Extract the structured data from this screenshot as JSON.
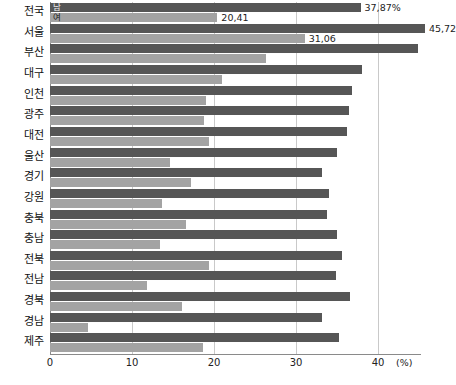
{
  "chart_data": {
    "type": "bar",
    "orientation": "horizontal",
    "title": "",
    "xlabel": "(%)",
    "ylabel": "",
    "xlim": [
      0,
      41
    ],
    "xticks": [
      0,
      10,
      20,
      30,
      40
    ],
    "xtick_labels": [
      "0",
      "10",
      "20",
      "30",
      "40"
    ],
    "unit": "(%)",
    "grid": true,
    "grid_axis": "x",
    "legend_position": "inside-first-bars",
    "categories": [
      "전국",
      "서울",
      "부산",
      "대구",
      "인천",
      "광주",
      "대전",
      "울산",
      "경기",
      "강원",
      "충북",
      "충남",
      "전북",
      "전남",
      "경북",
      "경남",
      "제주"
    ],
    "series": [
      {
        "name": "남",
        "color": "#565656",
        "values": [
          37.87,
          45.72,
          44.9,
          38.1,
          36.8,
          36.5,
          36.2,
          35.0,
          33.2,
          34.0,
          33.8,
          35.0,
          35.6,
          34.9,
          36.6,
          33.2,
          35.3
        ]
      },
      {
        "name": "여",
        "color": "#a3a3a3",
        "values": [
          20.41,
          31.06,
          26.4,
          21.0,
          19.0,
          18.8,
          19.4,
          14.6,
          17.2,
          13.6,
          16.6,
          13.4,
          19.4,
          11.8,
          16.1,
          4.6,
          18.7
        ]
      }
    ],
    "data_labels": {
      "전국": {
        "남": "37,87%",
        "여": "20,41"
      },
      "서울": {
        "남": "45,72",
        "여": "31,06"
      }
    },
    "legend_inline": {
      "male": "남",
      "female": "여"
    },
    "footnote": ""
  }
}
